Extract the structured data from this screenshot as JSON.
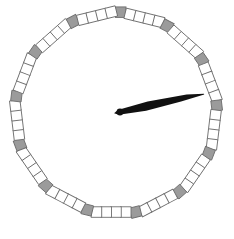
{
  "widget": {
    "name": "polygonal-dial-gauge",
    "width": 234,
    "height": 239,
    "background_color": "#ffffff"
  },
  "dial": {
    "label": "Polygonal tick dial",
    "shape": "polygon",
    "sides": 13,
    "center": {
      "x": 116,
      "y": 113
    },
    "radius": 102,
    "rotation_deg": -90,
    "tick": {
      "size": 10.5,
      "outline_color": "#6e6e6e",
      "outline_width": 0.9,
      "vertex_fill": "#9b9b9b",
      "segment_fill": "#ffffff",
      "ticks_between_vertices": 4,
      "total_ticks": 65
    }
  },
  "needle": {
    "label": "pointer-needle",
    "color": "#111111",
    "angle_deg": -12,
    "length": 86,
    "tail_length": 6,
    "max_half_width": 4.6,
    "pivot": {
      "x": 120,
      "y": 112
    },
    "pivot_radius": 3.4,
    "tip": {
      "x": 205,
      "y": 94
    }
  }
}
